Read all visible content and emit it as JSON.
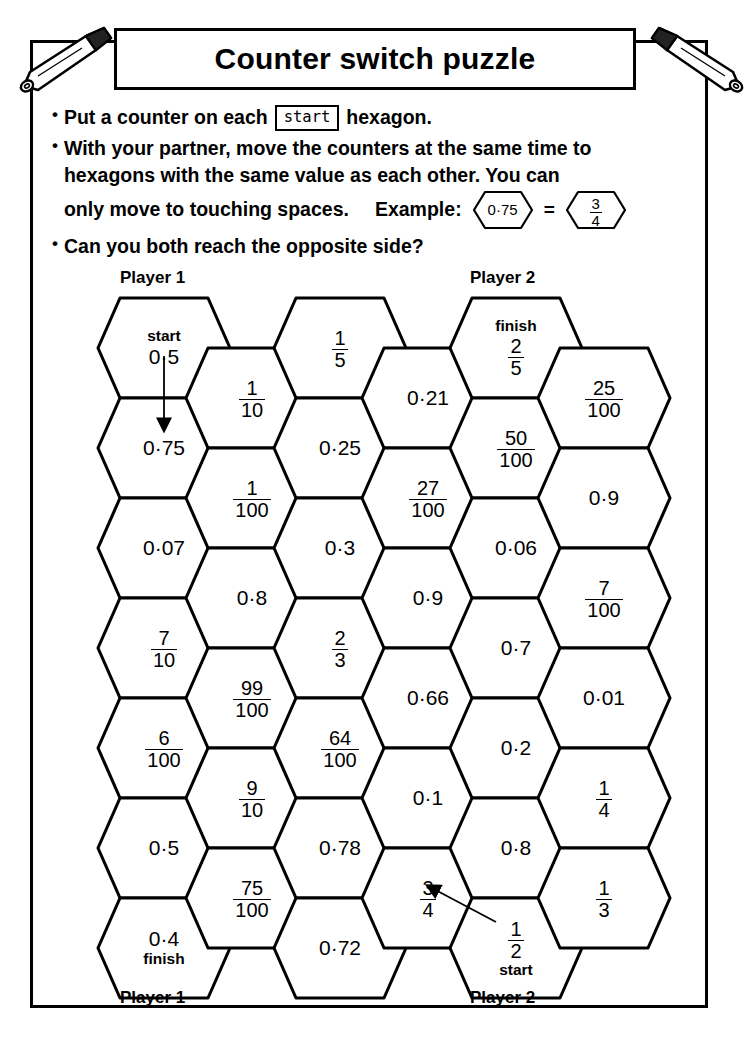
{
  "document": {
    "title": "Counter switch puzzle"
  },
  "instructions": {
    "bullet": "•",
    "items": [
      {
        "id": "rule-place-counter",
        "pre": "Put a counter on each",
        "chip": "start",
        "post": "hexagon."
      },
      {
        "id": "rule-move-counters",
        "line1": "With your partner, move the counters at the same time to",
        "line2": "hexagons with the same value as each other. You can",
        "line3": "only move to touching spaces.",
        "example_label": "Example:",
        "example_left": "0·75",
        "example_eq": "=",
        "example_right_num": "3",
        "example_right_den": "4"
      },
      {
        "id": "rule-opposite-side",
        "text": "Can you both reach the opposite side?"
      }
    ]
  },
  "board": {
    "captions": {
      "top_left": "Player 1",
      "top_right": "Player 2",
      "bottom_left": "Player 1",
      "bottom_right": "Player 2"
    },
    "tags": {
      "start": "start",
      "finish": "finish"
    },
    "columns": [
      {
        "index": 1,
        "cells": [
          {
            "value": "0·5",
            "type": "decimal",
            "tag": "start",
            "tag_pos": "top"
          },
          {
            "value": "0·75",
            "type": "decimal"
          },
          {
            "value": "0·07",
            "type": "decimal"
          },
          {
            "num": "7",
            "den": "10",
            "type": "fraction"
          },
          {
            "num": "6",
            "den": "100",
            "type": "fraction"
          },
          {
            "value": "0·5",
            "type": "decimal"
          },
          {
            "value": "0·4",
            "type": "decimal",
            "tag": "finish",
            "tag_pos": "bottom"
          }
        ]
      },
      {
        "index": 2,
        "cells": [
          {
            "num": "1",
            "den": "10",
            "type": "fraction"
          },
          {
            "num": "1",
            "den": "100",
            "type": "fraction"
          },
          {
            "value": "0·8",
            "type": "decimal"
          },
          {
            "num": "99",
            "den": "100",
            "type": "fraction"
          },
          {
            "num": "9",
            "den": "10",
            "type": "fraction"
          },
          {
            "num": "75",
            "den": "100",
            "type": "fraction"
          }
        ]
      },
      {
        "index": 3,
        "cells": [
          {
            "num": "1",
            "den": "5",
            "type": "fraction"
          },
          {
            "value": "0·25",
            "type": "decimal"
          },
          {
            "value": "0·3",
            "type": "decimal"
          },
          {
            "num": "2",
            "den": "3",
            "type": "fraction"
          },
          {
            "num": "64",
            "den": "100",
            "type": "fraction"
          },
          {
            "value": "0·78",
            "type": "decimal"
          },
          {
            "value": "0·72",
            "type": "decimal"
          }
        ]
      },
      {
        "index": 4,
        "cells": [
          {
            "value": "0·21",
            "type": "decimal"
          },
          {
            "num": "27",
            "den": "100",
            "type": "fraction"
          },
          {
            "value": "0·9",
            "type": "decimal"
          },
          {
            "value": "0·66",
            "type": "decimal"
          },
          {
            "value": "0·1",
            "type": "decimal"
          },
          {
            "num": "3",
            "den": "4",
            "type": "fraction"
          }
        ]
      },
      {
        "index": 5,
        "cells": [
          {
            "num": "2",
            "den": "5",
            "type": "fraction",
            "tag": "finish",
            "tag_pos": "top"
          },
          {
            "num": "50",
            "den": "100",
            "type": "fraction"
          },
          {
            "value": "0·06",
            "type": "decimal"
          },
          {
            "value": "0·7",
            "type": "decimal"
          },
          {
            "value": "0·2",
            "type": "decimal"
          },
          {
            "value": "0·8",
            "type": "decimal"
          },
          {
            "num": "1",
            "den": "2",
            "type": "fraction",
            "tag": "start",
            "tag_pos": "bottom"
          }
        ]
      },
      {
        "index": 6,
        "cells": [
          {
            "num": "25",
            "den": "100",
            "type": "fraction"
          },
          {
            "value": "0·9",
            "type": "decimal"
          },
          {
            "num": "7",
            "den": "100",
            "type": "fraction"
          },
          {
            "value": "0·01",
            "type": "decimal"
          },
          {
            "num": "1",
            "den": "4",
            "type": "fraction"
          },
          {
            "num": "1",
            "den": "3",
            "type": "fraction"
          }
        ]
      }
    ],
    "annotations": [
      {
        "id": "arrow-player1",
        "from": "col1-row1",
        "to": "col1-row2"
      },
      {
        "id": "arrow-player2",
        "from": "col5-row7",
        "to": "col4-row6"
      }
    ]
  },
  "colors": {
    "ink": "#000000",
    "paper": "#ffffff",
    "pencil_body": "#ffffff"
  }
}
